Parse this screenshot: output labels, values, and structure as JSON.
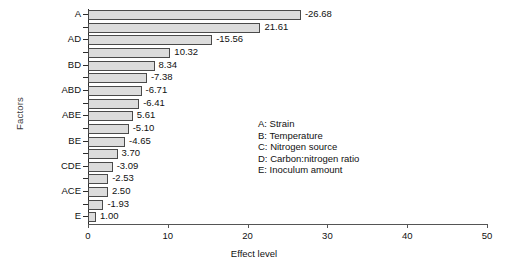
{
  "chart_data": {
    "type": "bar",
    "orientation": "horizontal",
    "title": "",
    "xlabel": "Effect level",
    "ylabel": "Factors",
    "xlim": [
      0,
      50
    ],
    "xticks": [
      0,
      10,
      20,
      30,
      40,
      50
    ],
    "grid": false,
    "legend_position": "center-right",
    "categories": [
      "A",
      "",
      "AD",
      "",
      "BD",
      "",
      "ABD",
      "",
      "ABE",
      "",
      "BE",
      "",
      "CDE",
      "",
      "ACE",
      "",
      "E"
    ],
    "values": [
      26.68,
      21.61,
      15.56,
      10.32,
      8.34,
      7.38,
      6.71,
      6.41,
      5.61,
      5.1,
      4.65,
      3.7,
      3.09,
      2.53,
      2.5,
      1.93,
      1.0
    ],
    "data_labels": [
      "-26.68",
      "21.61",
      "-15.56",
      "10.32",
      "8.34",
      "-7.38",
      "-6.71",
      "-6.41",
      "5.61",
      "-5.10",
      "-4.65",
      "3.70",
      "-3.09",
      "-2.53",
      "2.50",
      "-1.93",
      "1.00"
    ],
    "bar_color": "#dcdcdc",
    "bar_edge_color": "#4a4a4a"
  },
  "legend": {
    "items": [
      "A: Strain",
      "B: Temperature",
      "C: Nitrogen source",
      "D: Carbon:nitrogen ratio",
      "E: Inoculum amount"
    ]
  }
}
